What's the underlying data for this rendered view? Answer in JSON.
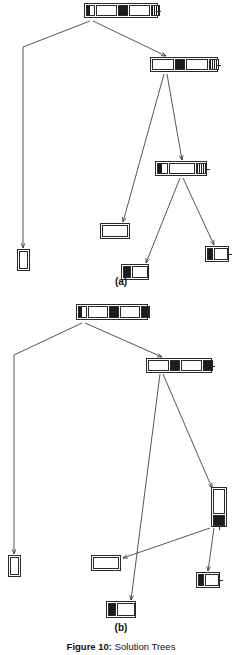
{
  "figure": {
    "caption_label": "Figure 10:",
    "caption_text": " Solution Trees",
    "panels": [
      {
        "id": "a",
        "label": "(a)"
      },
      {
        "id": "b",
        "label": "(b)"
      }
    ]
  },
  "colors": {
    "ink": "#1c1c1c",
    "stroke": "#2a2a2a",
    "paper": "#ffffff"
  },
  "panel_a": {
    "name": "solution-tree-a",
    "nodes": [
      {
        "id": "a-root",
        "name": "tree-node-root",
        "role": "root",
        "x": 84,
        "y": 3,
        "w": 74,
        "h": 15,
        "orient": "horizontal",
        "pin": true,
        "segments": [
          "half",
          "ring",
          "fill",
          "ring",
          "stripe"
        ]
      },
      {
        "id": "a-n2",
        "name": "tree-node-level1-right",
        "role": "internal",
        "x": 150,
        "y": 57,
        "w": 68,
        "h": 15,
        "orient": "horizontal",
        "pin": true,
        "segments": [
          "ring",
          "fill",
          "ring",
          "stripe"
        ]
      },
      {
        "id": "a-n3",
        "name": "tree-node-level2",
        "role": "internal",
        "x": 155,
        "y": 161,
        "w": 52,
        "h": 15,
        "orient": "horizontal",
        "pin": true,
        "segments": [
          "half",
          "ring",
          "stripe"
        ]
      },
      {
        "id": "a-leaf1",
        "name": "tree-leaf-far-left",
        "role": "leaf",
        "x": 17,
        "y": 249,
        "w": 13,
        "h": 22,
        "orient": "vertical",
        "pin": false,
        "segments": [
          "ring"
        ]
      },
      {
        "id": "a-leaf2",
        "name": "tree-leaf-middle",
        "role": "leaf",
        "x": 100,
        "y": 223,
        "w": 30,
        "h": 16,
        "orient": "horizontal",
        "pin": false,
        "segments": [
          "ring"
        ]
      },
      {
        "id": "a-leaf3",
        "name": "tree-leaf-bottom",
        "role": "leaf",
        "x": 121,
        "y": 264,
        "w": 28,
        "h": 16,
        "orient": "horizontal",
        "pin": false,
        "segments": [
          "fill",
          "ring"
        ]
      },
      {
        "id": "a-leaf4",
        "name": "tree-leaf-right",
        "role": "leaf",
        "x": 205,
        "y": 246,
        "w": 24,
        "h": 16,
        "orient": "horizontal",
        "pin": true,
        "segments": [
          "fill",
          "ring"
        ]
      }
    ],
    "edges": [
      {
        "name": "edge-root-to-leaf-far-left",
        "from": "a-root",
        "to": "a-leaf1",
        "path": "M 90 21 L 23 47 L 23 248"
      },
      {
        "name": "edge-root-to-level1-right",
        "from": "a-root",
        "to": "a-n2",
        "path": "M 93 21 L 166 56"
      },
      {
        "name": "edge-level1-to-leaf-middle",
        "from": "a-n2",
        "to": "a-leaf2",
        "path": "M 164 74 L 123 222"
      },
      {
        "name": "edge-level1-to-level2",
        "from": "a-n2",
        "to": "a-n3",
        "path": "M 167 74 L 182 160"
      },
      {
        "name": "edge-level2-to-leaf-bottom",
        "from": "a-n3",
        "to": "a-leaf3",
        "path": "M 180 178 L 146 263"
      },
      {
        "name": "edge-level2-to-leaf-right",
        "from": "a-n3",
        "to": "a-leaf4",
        "path": "M 183 178 L 214 245"
      }
    ]
  },
  "panel_b": {
    "name": "solution-tree-b",
    "nodes": [
      {
        "id": "b-root",
        "name": "tree-node-root",
        "role": "root",
        "x": 76,
        "y": 4,
        "w": 72,
        "h": 16,
        "orient": "horizontal",
        "pin": false,
        "segments": [
          "half",
          "ring",
          "fill",
          "ring",
          "fill"
        ]
      },
      {
        "id": "b-n2",
        "name": "tree-node-level1-right",
        "role": "internal",
        "x": 146,
        "y": 58,
        "w": 66,
        "h": 15,
        "orient": "horizontal",
        "pin": true,
        "segments": [
          "ring",
          "fill",
          "ring",
          "fill"
        ]
      },
      {
        "id": "b-n3",
        "name": "tree-node-level2-vert",
        "role": "internal",
        "x": 211,
        "y": 187,
        "w": 16,
        "h": 40,
        "orient": "vertical",
        "pin": true,
        "segments": [
          "ring",
          "fill"
        ]
      },
      {
        "id": "b-leaf1",
        "name": "tree-leaf-far-left",
        "role": "leaf",
        "x": 8,
        "y": 255,
        "w": 13,
        "h": 22,
        "orient": "vertical",
        "pin": false,
        "segments": [
          "ring"
        ]
      },
      {
        "id": "b-leaf2",
        "name": "tree-leaf-middle",
        "role": "leaf",
        "x": 91,
        "y": 255,
        "w": 30,
        "h": 16,
        "orient": "horizontal",
        "pin": false,
        "segments": [
          "ring"
        ]
      },
      {
        "id": "b-leaf3",
        "name": "tree-leaf-bottom",
        "role": "leaf",
        "x": 106,
        "y": 301,
        "w": 30,
        "h": 17,
        "orient": "horizontal",
        "pin": false,
        "segments": [
          "fill",
          "ring"
        ]
      },
      {
        "id": "b-leaf4",
        "name": "tree-leaf-right",
        "role": "leaf",
        "x": 196,
        "y": 272,
        "w": 24,
        "h": 16,
        "orient": "horizontal",
        "pin": true,
        "segments": [
          "fill",
          "ring"
        ]
      }
    ],
    "edges": [
      {
        "name": "edge-root-to-leaf-far-left",
        "from": "b-root",
        "to": "b-leaf1",
        "path": "M 82 23 L 14 55 L 14 254"
      },
      {
        "name": "edge-root-to-level1-right",
        "from": "b-root",
        "to": "b-n2",
        "path": "M 85 23 L 162 57"
      },
      {
        "name": "edge-level1-to-leaf-bottom",
        "from": "b-n2",
        "to": "b-leaf3",
        "path": "M 160 74 L 131 300"
      },
      {
        "name": "edge-level1-to-level2-vert",
        "from": "b-n2",
        "to": "b-n3",
        "path": "M 163 74 L 212 188"
      },
      {
        "name": "edge-level2-to-leaf-middle",
        "from": "b-n3",
        "to": "b-leaf2",
        "path": "M 210 228 L 123 258"
      },
      {
        "name": "edge-level2-to-leaf-right",
        "from": "b-n3",
        "to": "b-leaf4",
        "path": "M 214 228 L 208 271"
      }
    ]
  }
}
